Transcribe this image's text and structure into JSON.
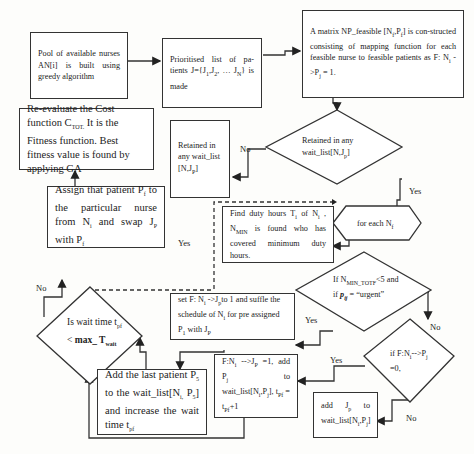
{
  "diagram": {
    "type": "flowchart",
    "nodes": [
      {
        "id": "pool",
        "shape": "rectangle",
        "text": "Pool of available nurses AN[i] is built using greedy algorithm"
      },
      {
        "id": "prioritised",
        "shape": "rectangle",
        "text": "Prioritised list of patients J={J1,J2, … JN} is made"
      },
      {
        "id": "matrix",
        "shape": "rectangle",
        "text": "A matrix NP_feasible [Nf,Pf] is constructed consisting of mapping function for each feasible nurse to feasible patients as F: Ni ->Pj = 1."
      },
      {
        "id": "retained_decision",
        "shape": "diamond",
        "text": "Retained in any wait_list[N,Jp]"
      },
      {
        "id": "retained_box",
        "shape": "rectangle",
        "text": "Retained in any wait_list [N,Jp]"
      },
      {
        "id": "reevaluate",
        "shape": "rectangle",
        "text": "Re-evaluate the Cost function CTOT. It is the Fitness function. Best fitness value is found by applying GA"
      },
      {
        "id": "for_each",
        "shape": "hexagon",
        "text": "for each Nf"
      },
      {
        "id": "find_duty",
        "shape": "rectangle",
        "text": "Find duty hours Ti of Ni , NMIN is found who has covered minimum duty hours."
      },
      {
        "id": "assign",
        "shape": "rectangle",
        "text": "Assign that patient Pf to the particular nurse from Ni and swap JP with Pf"
      },
      {
        "id": "urgent_decision",
        "shape": "diamond",
        "text": "If NMIN_TOTF<5 and if pij = \"urgent\""
      },
      {
        "id": "set_f",
        "shape": "rectangle",
        "text": "set F: Ni ->Jp to 1 and suffle the schedule of Ni for pre assigned P1 with JP"
      },
      {
        "id": "wait_decision",
        "shape": "diamond",
        "text": "Is wait time tpf < max_Twait"
      },
      {
        "id": "f_decision",
        "shape": "diamond",
        "text": "if F:Ni-->Pj =0,"
      },
      {
        "id": "add_last",
        "shape": "rectangle",
        "text": "Add the last patient P5 to the wait_list[Ni, P5] and increase the wait time tpf"
      },
      {
        "id": "f_ni_box",
        "shape": "rectangle",
        "text": "F:Ni -->Jp =1, add Pj to wait_list[Ni,Pj], tpf = tpf+1"
      },
      {
        "id": "add_jp",
        "shape": "rectangle",
        "text": "add Jp to wait_list[Ni,Pj]"
      }
    ],
    "edges": [
      {
        "from": "pool",
        "to": "prioritised"
      },
      {
        "from": "prioritised",
        "to": "matrix"
      },
      {
        "from": "matrix",
        "to": "retained_decision"
      },
      {
        "from": "retained_decision",
        "to": "retained_box",
        "label": "No"
      },
      {
        "from": "retained_decision",
        "to": "for_each",
        "label": "Yes"
      },
      {
        "from": "retained_decision",
        "to": "find_duty",
        "style": "dashed"
      },
      {
        "from": "for_each",
        "to": "find_duty"
      },
      {
        "from": "find_duty",
        "to": "urgent_decision"
      },
      {
        "from": "urgent_decision",
        "to": "set_f",
        "label": "Yes"
      },
      {
        "from": "urgent_decision",
        "to": "f_decision",
        "label": "No"
      },
      {
        "from": "f_decision",
        "to": "f_ni_box",
        "label": "Yes"
      },
      {
        "from": "f_decision",
        "to": "add_jp",
        "label": "No"
      },
      {
        "from": "set_f",
        "to": "add_last"
      },
      {
        "from": "add_last",
        "to": "wait_decision"
      },
      {
        "from": "f_ni_box",
        "to": "wait_decision"
      },
      {
        "from": "wait_decision",
        "to": "assign",
        "label": "No"
      },
      {
        "from": "wait_decision",
        "to": "find_duty",
        "label": "Yes",
        "style": "dashed"
      },
      {
        "from": "assign",
        "to": "reevaluate"
      }
    ]
  },
  "labels": {
    "no": "No",
    "yes": "Yes"
  },
  "colors": {
    "line": "#333333",
    "background": "#fdfdfb"
  }
}
